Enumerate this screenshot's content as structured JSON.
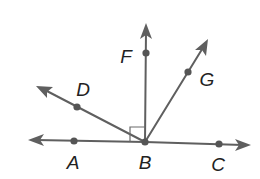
{
  "diagram": {
    "type": "geometry-rays",
    "colors": {
      "line": "#5f5f5f",
      "point": "#555555",
      "label": "#222222"
    },
    "vertex": "B",
    "points": {
      "A": {
        "label": "A",
        "x": 74,
        "y": 141
      },
      "B": {
        "label": "B",
        "x": 145,
        "y": 142
      },
      "C": {
        "label": "C",
        "x": 219,
        "y": 144
      },
      "D": {
        "label": "D",
        "x": 77,
        "y": 107
      },
      "F": {
        "label": "F",
        "x": 146,
        "y": 53
      },
      "G": {
        "label": "G",
        "x": 188,
        "y": 72
      }
    },
    "rays": [
      {
        "name": "BA",
        "from": "B",
        "through": "A"
      },
      {
        "name": "BC",
        "from": "B",
        "through": "C"
      },
      {
        "name": "BD",
        "from": "B",
        "through": "D"
      },
      {
        "name": "BF",
        "from": "B",
        "through": "F"
      },
      {
        "name": "BG",
        "from": "B",
        "through": "G"
      }
    ],
    "annotations": [
      {
        "type": "right-angle-mark",
        "angle": "ABF"
      }
    ]
  }
}
